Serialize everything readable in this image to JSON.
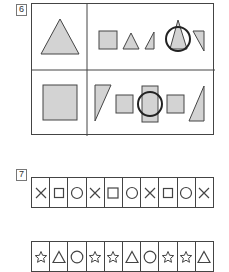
{
  "questions": [
    {
      "number": "6",
      "grid": {
        "rows": [
          {
            "reference": "triangle",
            "options": [
              "square",
              "triangle-small",
              "right-triangle",
              "triangle-circled",
              "right-triangle-inverted"
            ],
            "circled_option": "triangle-circled"
          },
          {
            "reference": "square",
            "options": [
              "right-triangle-inverted",
              "square",
              "rectangle-tall-circled",
              "square",
              "right-triangle"
            ],
            "circled_option": "rectangle-tall-circled"
          }
        ]
      },
      "colors": {
        "fill": "#d3d3d3",
        "stroke": "#444444",
        "circle": "#222222"
      }
    },
    {
      "number": "7",
      "rows": [
        [
          "cross",
          "square",
          "circle",
          "cross",
          "square",
          "circle",
          "cross",
          "square",
          "circle",
          "cross"
        ],
        [
          "star",
          "triangle",
          "circle",
          "star",
          "star",
          "triangle",
          "circle",
          "star",
          "star",
          "triangle"
        ]
      ]
    }
  ]
}
